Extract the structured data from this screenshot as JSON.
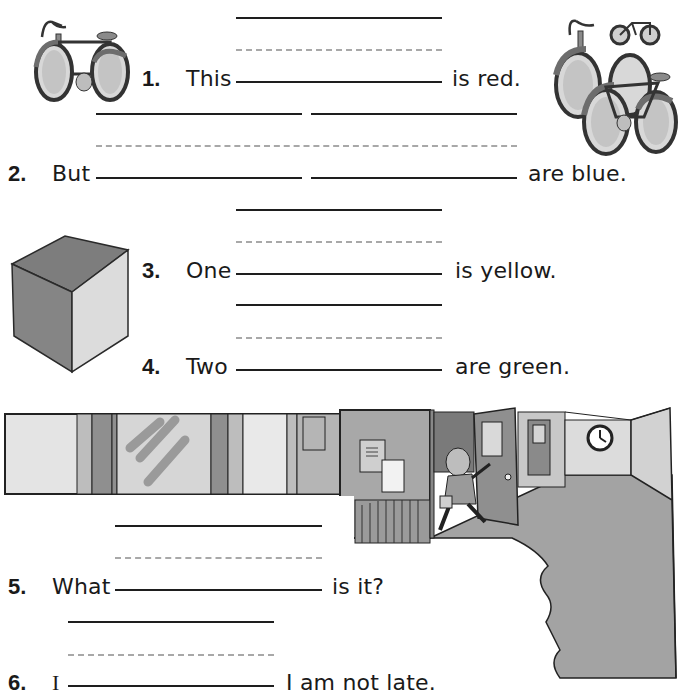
{
  "worksheet": {
    "items": [
      {
        "number": "1.",
        "before": "This",
        "after": "is red.",
        "blanks": 1
      },
      {
        "number": "2.",
        "before": "But",
        "after": "are blue.",
        "blanks": 2
      },
      {
        "number": "3.",
        "before": "One",
        "after": "is yellow.",
        "blanks": 1
      },
      {
        "number": "4.",
        "before": "Two",
        "after": "are green.",
        "blanks": 1
      },
      {
        "number": "5.",
        "before": "What",
        "after": "is it?",
        "blanks": 1
      },
      {
        "number": "6.",
        "before": "I",
        "after": "I am not late.",
        "blanks": 1
      }
    ],
    "illustrations": {
      "item1": "single-bicycle",
      "item2": "group-of-bicycles",
      "item3": "cube",
      "item5": "school-hallway-with-clock",
      "item6": "girl-running-through-door"
    },
    "colors": {
      "ink": "#1e1e1e",
      "guide_dash": "#a8a8a8",
      "gray_dark": "#7a7a7a",
      "gray_mid": "#9c9c9c",
      "gray_light": "#cfcfcf",
      "gray_pale": "#e6e6e6"
    }
  }
}
